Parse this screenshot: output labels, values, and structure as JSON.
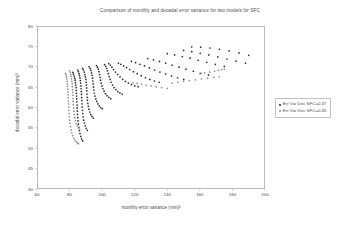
{
  "chart_data": {
    "type": "scatter",
    "title": "Comparison of monthly and decadal error variance for two models for SFC",
    "xlabel": "monthly error variance (mm)²",
    "ylabel": "decadal error variance (mm)²",
    "xlim": [
      60,
      200
    ],
    "ylim": [
      40,
      80
    ],
    "xticks": [
      60,
      80,
      100,
      120,
      140,
      160,
      180,
      200
    ],
    "yticks": [
      40,
      45,
      50,
      55,
      60,
      65,
      70,
      75,
      80
    ],
    "grid": false,
    "legend_position": "right",
    "series": [
      {
        "name": "Err Var Dec SFC=0.37",
        "color": "#2b2b2b",
        "marker": "dot",
        "points": [
          [
            82.0,
            68.6
          ],
          [
            82.4,
            68.2
          ],
          [
            82.8,
            67.7
          ],
          [
            83.1,
            67.2
          ],
          [
            83.4,
            66.7
          ],
          [
            83.6,
            66.1
          ],
          [
            83.8,
            65.5
          ],
          [
            84.0,
            64.9
          ],
          [
            84.1,
            64.2
          ],
          [
            84.2,
            63.5
          ],
          [
            84.3,
            62.8
          ],
          [
            84.4,
            62.1
          ],
          [
            84.5,
            61.4
          ],
          [
            84.6,
            60.6
          ],
          [
            84.7,
            59.9
          ],
          [
            84.8,
            59.1
          ],
          [
            84.9,
            58.3
          ],
          [
            85.0,
            57.5
          ],
          [
            85.2,
            56.7
          ],
          [
            85.4,
            55.9
          ],
          [
            85.7,
            55.1
          ],
          [
            86.0,
            54.3
          ],
          [
            86.4,
            53.6
          ],
          [
            86.9,
            52.9
          ],
          [
            87.4,
            52.3
          ],
          [
            88.0,
            51.8
          ],
          [
            85.0,
            69.2
          ],
          [
            85.4,
            68.8
          ],
          [
            85.8,
            68.3
          ],
          [
            86.1,
            67.8
          ],
          [
            86.4,
            67.2
          ],
          [
            86.6,
            66.6
          ],
          [
            86.8,
            66.0
          ],
          [
            87.0,
            65.3
          ],
          [
            87.1,
            64.6
          ],
          [
            87.2,
            63.9
          ],
          [
            87.3,
            63.2
          ],
          [
            87.4,
            62.4
          ],
          [
            87.5,
            61.7
          ],
          [
            87.6,
            60.9
          ],
          [
            87.7,
            60.1
          ],
          [
            87.9,
            59.3
          ],
          [
            88.1,
            58.5
          ],
          [
            88.4,
            57.7
          ],
          [
            88.7,
            56.9
          ],
          [
            89.1,
            56.2
          ],
          [
            89.6,
            55.5
          ],
          [
            90.2,
            54.9
          ],
          [
            90.9,
            54.4
          ],
          [
            88.0,
            69.6
          ],
          [
            88.5,
            69.2
          ],
          [
            89.0,
            68.7
          ],
          [
            89.4,
            68.1
          ],
          [
            89.7,
            67.5
          ],
          [
            90.0,
            66.9
          ],
          [
            90.2,
            66.2
          ],
          [
            90.4,
            65.5
          ],
          [
            90.5,
            64.8
          ],
          [
            90.6,
            64.1
          ],
          [
            90.7,
            63.3
          ],
          [
            90.8,
            62.5
          ],
          [
            91.0,
            61.8
          ],
          [
            91.2,
            61.0
          ],
          [
            91.5,
            60.3
          ],
          [
            91.9,
            59.6
          ],
          [
            92.4,
            58.9
          ],
          [
            93.0,
            58.3
          ],
          [
            93.7,
            57.8
          ],
          [
            94.5,
            57.4
          ],
          [
            92.0,
            70.0
          ],
          [
            92.6,
            69.6
          ],
          [
            93.1,
            69.1
          ],
          [
            93.5,
            68.5
          ],
          [
            93.8,
            67.9
          ],
          [
            94.1,
            67.2
          ],
          [
            94.3,
            66.5
          ],
          [
            94.5,
            65.8
          ],
          [
            94.7,
            65.0
          ],
          [
            94.9,
            64.3
          ],
          [
            95.2,
            63.5
          ],
          [
            95.6,
            62.8
          ],
          [
            96.1,
            62.1
          ],
          [
            96.7,
            61.5
          ],
          [
            97.4,
            60.9
          ],
          [
            98.2,
            60.4
          ],
          [
            99.1,
            60.0
          ],
          [
            100.1,
            59.7
          ],
          [
            96.5,
            70.3
          ],
          [
            97.1,
            69.9
          ],
          [
            97.6,
            69.4
          ],
          [
            98.0,
            68.8
          ],
          [
            98.4,
            68.1
          ],
          [
            98.7,
            67.4
          ],
          [
            99.0,
            66.7
          ],
          [
            99.4,
            66.0
          ],
          [
            99.9,
            65.3
          ],
          [
            100.5,
            64.6
          ],
          [
            101.2,
            64.0
          ],
          [
            102.0,
            63.4
          ],
          [
            103.0,
            62.9
          ],
          [
            104.1,
            62.5
          ],
          [
            105.3,
            62.2
          ],
          [
            101.5,
            70.5
          ],
          [
            102.2,
            70.1
          ],
          [
            102.8,
            69.6
          ],
          [
            103.3,
            69.0
          ],
          [
            103.8,
            68.3
          ],
          [
            104.3,
            67.6
          ],
          [
            104.9,
            66.9
          ],
          [
            105.6,
            66.2
          ],
          [
            106.4,
            65.5
          ],
          [
            107.3,
            64.9
          ],
          [
            108.4,
            64.4
          ],
          [
            109.6,
            63.9
          ],
          [
            110.9,
            63.6
          ],
          [
            112.3,
            63.3
          ],
          [
            104.0,
            70.8
          ],
          [
            105.0,
            70.4
          ],
          [
            106.0,
            69.9
          ],
          [
            107.0,
            69.3
          ],
          [
            108.2,
            68.7
          ],
          [
            109.5,
            68.1
          ],
          [
            111.0,
            67.5
          ],
          [
            112.6,
            66.9
          ],
          [
            114.3,
            66.4
          ],
          [
            116.1,
            66.0
          ],
          [
            118.0,
            65.6
          ],
          [
            120.0,
            65.3
          ],
          [
            122.1,
            65.1
          ],
          [
            110.0,
            70.9
          ],
          [
            111.5,
            70.6
          ],
          [
            113.2,
            70.2
          ],
          [
            115.0,
            69.8
          ],
          [
            117.0,
            69.3
          ],
          [
            119.2,
            68.8
          ],
          [
            121.5,
            68.3
          ],
          [
            124.0,
            67.8
          ],
          [
            126.6,
            67.3
          ],
          [
            129.3,
            66.9
          ],
          [
            132.1,
            66.5
          ],
          [
            135.0,
            66.2
          ],
          [
            118.0,
            71.3
          ],
          [
            120.5,
            71.0
          ],
          [
            123.2,
            70.6
          ],
          [
            126.0,
            70.2
          ],
          [
            129.0,
            69.7
          ],
          [
            132.2,
            69.2
          ],
          [
            135.5,
            68.7
          ],
          [
            139.0,
            68.2
          ],
          [
            142.6,
            67.7
          ],
          [
            146.3,
            67.3
          ],
          [
            150.1,
            66.9
          ],
          [
            128.0,
            72.0
          ],
          [
            131.5,
            71.7
          ],
          [
            135.2,
            71.3
          ],
          [
            139.0,
            70.9
          ],
          [
            143.0,
            70.4
          ],
          [
            147.2,
            69.9
          ],
          [
            151.5,
            69.4
          ],
          [
            156.0,
            68.9
          ],
          [
            160.6,
            68.4
          ],
          [
            165.3,
            68.0
          ],
          [
            140.0,
            73.2
          ],
          [
            144.5,
            72.9
          ],
          [
            149.2,
            72.5
          ],
          [
            154.0,
            72.1
          ],
          [
            159.0,
            71.6
          ],
          [
            164.2,
            71.1
          ],
          [
            169.5,
            70.6
          ],
          [
            175.0,
            70.1
          ],
          [
            150.0,
            74.0
          ],
          [
            155.0,
            73.7
          ],
          [
            160.2,
            73.3
          ],
          [
            165.5,
            72.9
          ],
          [
            171.0,
            72.4
          ],
          [
            176.6,
            71.9
          ],
          [
            182.3,
            71.4
          ],
          [
            188.0,
            70.9
          ],
          [
            155.0,
            74.9
          ],
          [
            160.5,
            74.8
          ],
          [
            166.2,
            74.6
          ],
          [
            172.0,
            74.3
          ],
          [
            178.0,
            73.9
          ],
          [
            184.0,
            73.4
          ],
          [
            190.0,
            72.8
          ]
        ]
      },
      {
        "name": "Err Var Dec SFC=0.45",
        "color": "#8d8d8d",
        "marker": "dot",
        "points": [
          [
            77.5,
            68.4
          ],
          [
            77.8,
            68.0
          ],
          [
            78.1,
            67.5
          ],
          [
            78.3,
            67.0
          ],
          [
            78.5,
            66.4
          ],
          [
            78.7,
            65.8
          ],
          [
            78.8,
            65.2
          ],
          [
            78.9,
            64.5
          ],
          [
            79.0,
            63.8
          ],
          [
            79.1,
            63.1
          ],
          [
            79.2,
            62.4
          ],
          [
            79.3,
            61.6
          ],
          [
            79.4,
            60.9
          ],
          [
            79.5,
            60.1
          ],
          [
            79.6,
            59.3
          ],
          [
            79.7,
            58.5
          ],
          [
            79.9,
            57.7
          ],
          [
            80.1,
            56.9
          ],
          [
            80.3,
            56.1
          ],
          [
            80.6,
            55.3
          ],
          [
            81.0,
            54.5
          ],
          [
            81.4,
            53.8
          ],
          [
            81.9,
            53.1
          ],
          [
            82.5,
            52.5
          ],
          [
            83.2,
            52.0
          ],
          [
            84.0,
            51.6
          ],
          [
            84.8,
            51.3
          ],
          [
            85.5,
            51.1
          ],
          [
            80.0,
            69.0
          ],
          [
            80.4,
            68.6
          ],
          [
            80.7,
            68.1
          ],
          [
            81.0,
            67.6
          ],
          [
            81.2,
            67.0
          ],
          [
            81.4,
            66.4
          ],
          [
            81.6,
            65.8
          ],
          [
            81.7,
            65.1
          ],
          [
            81.8,
            64.4
          ],
          [
            81.9,
            63.7
          ],
          [
            82.0,
            63.0
          ],
          [
            82.1,
            62.2
          ],
          [
            82.2,
            61.5
          ],
          [
            82.3,
            60.7
          ],
          [
            82.5,
            59.9
          ],
          [
            82.7,
            59.1
          ],
          [
            82.9,
            58.3
          ],
          [
            83.2,
            57.5
          ],
          [
            83.6,
            56.8
          ],
          [
            84.1,
            56.1
          ],
          [
            84.7,
            55.5
          ],
          [
            85.4,
            55.0
          ],
          [
            86.2,
            54.6
          ],
          [
            119.0,
            66.0
          ],
          [
            121.5,
            65.9
          ],
          [
            124.2,
            65.7
          ],
          [
            127.0,
            65.5
          ],
          [
            130.0,
            65.3
          ],
          [
            133.2,
            65.1
          ],
          [
            136.5,
            64.9
          ],
          [
            140.0,
            64.7
          ],
          [
            143.0,
            66.0
          ],
          [
            146.5,
            66.2
          ],
          [
            150.0,
            66.4
          ],
          [
            153.6,
            66.6
          ],
          [
            157.3,
            66.8
          ],
          [
            161.0,
            67.0
          ],
          [
            164.8,
            67.2
          ],
          [
            168.6,
            67.4
          ],
          [
            172.0,
            67.6
          ],
          [
            160.0,
            68.3
          ],
          [
            163.0,
            68.5
          ],
          [
            166.0,
            68.7
          ],
          [
            169.0,
            68.9
          ],
          [
            171.5,
            69.1
          ],
          [
            173.5,
            69.3
          ],
          [
            175.0,
            69.5
          ]
        ]
      }
    ]
  }
}
